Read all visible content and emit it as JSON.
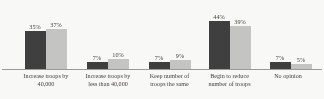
{
  "chart_data": {
    "type": "bar",
    "title": "",
    "subtitle": "",
    "xlabel": "",
    "ylabel": "",
    "ylim": [
      0,
      50
    ],
    "grid": false,
    "legend_position": "none",
    "categories": [
      "Increase troops by 40,000",
      "Increase troops by less than 40,000",
      "Keep number of troops the same",
      "Begin to reduce number of troops",
      "No opinion"
    ],
    "category_lines": [
      [
        "Increase troops by",
        "40,000"
      ],
      [
        "Increase troops by",
        "less than 40,000"
      ],
      [
        "Keep number of",
        "troops the same"
      ],
      [
        "Begin to reduce",
        "number of troops"
      ],
      [
        "No opinion",
        ""
      ]
    ],
    "series": [
      {
        "name": "series-1",
        "color": "#3a3a3a",
        "values": [
          35,
          7,
          7,
          44,
          7
        ],
        "labels": [
          "35%",
          "7%",
          "7%",
          "44%",
          "7%"
        ]
      },
      {
        "name": "series-2",
        "color": "#c6c6c4",
        "values": [
          37,
          10,
          9,
          39,
          5
        ],
        "labels": [
          "37%",
          "10%",
          "9%",
          "39%",
          "5%"
        ]
      }
    ]
  },
  "axis": {
    "baseline_color": "#9a9a97"
  }
}
